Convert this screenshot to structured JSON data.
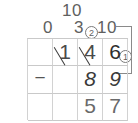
{
  "worksheet": {
    "type": "vertical-subtraction-with-regrouping",
    "operation": "subtraction",
    "minuend": "146",
    "subtrahend": "89",
    "difference": "57",
    "annotations": {
      "top_ten": "10",
      "tens_regroup_zero": "0",
      "hundreds_regroup_three": "3",
      "units_regroup_ten": "10",
      "step_badge_one": "1",
      "step_badge_two": "2"
    },
    "grid": {
      "columns": 4,
      "rows": 3,
      "rows_data": [
        {
          "name": "minuend-row",
          "cells": [
            {
              "value": "",
              "struck": false,
              "role": "empty"
            },
            {
              "value": "1",
              "struck": true,
              "role": "minuend"
            },
            {
              "value": "4",
              "struck": true,
              "role": "minuend"
            },
            {
              "value": "6",
              "struck": false,
              "role": "minuend"
            }
          ]
        },
        {
          "name": "subtrahend-row",
          "cells": [
            {
              "value": "−",
              "struck": false,
              "role": "operator"
            },
            {
              "value": "",
              "struck": false,
              "role": "empty"
            },
            {
              "value": "8",
              "struck": false,
              "role": "subtrahend"
            },
            {
              "value": "9",
              "struck": false,
              "role": "subtrahend"
            }
          ]
        },
        {
          "name": "difference-row",
          "cells": [
            {
              "value": "",
              "struck": false,
              "role": "empty"
            },
            {
              "value": "",
              "struck": false,
              "role": "empty"
            },
            {
              "value": "5",
              "struck": false,
              "role": "answer"
            },
            {
              "value": "7",
              "struck": false,
              "role": "answer"
            }
          ]
        }
      ]
    },
    "colors": {
      "ink": "#3c3c3c",
      "annotation_ink": "#5f5f5f",
      "grid_line": "#d0d0d0",
      "paper": "#ffffff"
    }
  }
}
